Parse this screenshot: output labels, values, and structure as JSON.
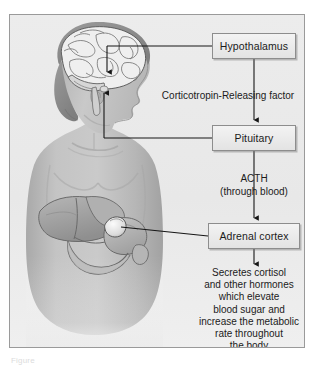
{
  "figure": {
    "caption": "Figure",
    "colors": {
      "page_background": "#ffffff",
      "panel_background": "#e9e9e9",
      "panel_border": "#9a9a9a",
      "box_fill": "#ecebeb",
      "box_border": "#8d8d8d",
      "text": "#1b1b1b",
      "connector": "#161616",
      "skin_light": "#c9c9c9",
      "skin_mid": "#b4b4b4",
      "skin_shadow": "#9d9d9d",
      "hair": "#8e8e8e",
      "brain_fill": "#efefef",
      "brain_line": "#6f6f6f",
      "organ_liver": "#a6a6a6",
      "organ_stomach": "#bdbdbd",
      "adrenal_highlight": "#f2f2f2"
    }
  },
  "flow": {
    "boxes": [
      {
        "id": "hypothalamus",
        "label": "Hypothalamus"
      },
      {
        "id": "pituitary",
        "label": "Pituitary"
      },
      {
        "id": "adrenal_cortex",
        "label": "Adrenal cortex"
      }
    ],
    "edge_labels": {
      "hypothalamus_to_pituitary": "Corticotropin-Releasing factor",
      "pituitary_to_adrenal_line1": "ACTH",
      "pituitary_to_adrenal_line2": "(through blood)"
    },
    "outcome_lines": [
      "Secretes cortisol",
      "and other hormones",
      "which elevate",
      "blood sugar and",
      "increase the metabolic",
      "rate throughout",
      "the body"
    ]
  },
  "anatomy": {
    "parts": [
      "head-profile",
      "hair",
      "brain",
      "brainstem",
      "eye",
      "ear",
      "neck",
      "torso",
      "shoulders",
      "clavicle",
      "liver",
      "stomach",
      "pancreas",
      "duodenum",
      "adrenal-gland"
    ]
  }
}
